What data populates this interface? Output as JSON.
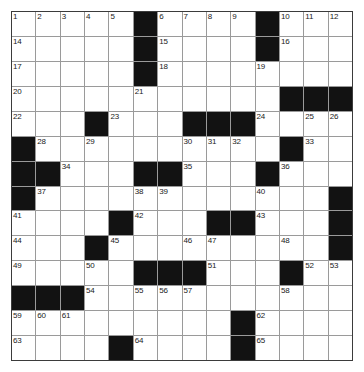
{
  "puzzle": {
    "type": "crossword-grid",
    "rows": 14,
    "cols": 14,
    "colors": {
      "block": "#121212",
      "cell": "#ffffff",
      "gridline": "#9a9a9a",
      "border": "#3b3b3b",
      "number_text": "#1a1a1a"
    },
    "grid": [
      [
        {
          "n": "1"
        },
        {
          "n": "2"
        },
        {
          "n": "3"
        },
        {
          "n": "4"
        },
        {
          "n": "5"
        },
        {
          "b": true
        },
        {
          "n": "6"
        },
        {
          "n": "7"
        },
        {
          "n": "8"
        },
        {
          "n": "9"
        },
        {
          "b": true
        },
        {
          "n": "10"
        },
        {
          "n": "11"
        },
        {
          "n": "12"
        }
      ],
      [
        {
          "n": "14"
        },
        {},
        {},
        {},
        {},
        {
          "b": true
        },
        {
          "n": "15"
        },
        {},
        {},
        {},
        {
          "b": true
        },
        {
          "n": "16"
        },
        {},
        {}
      ],
      [
        {
          "n": "17"
        },
        {},
        {},
        {},
        {},
        {
          "b": true
        },
        {
          "n": "18"
        },
        {},
        {},
        {},
        {
          "n": "19"
        },
        {},
        {},
        {}
      ],
      [
        {
          "n": "20"
        },
        {},
        {},
        {},
        {},
        {
          "n": "21"
        },
        {},
        {},
        {},
        {},
        {},
        {
          "b": true
        },
        {
          "b": true
        },
        {
          "b": true
        }
      ],
      [
        {
          "n": "22"
        },
        {},
        {},
        {
          "b": true
        },
        {
          "n": "23"
        },
        {},
        {},
        {
          "b": true
        },
        {
          "b": true
        },
        {
          "b": true
        },
        {
          "n": "24"
        },
        {},
        {
          "n": "25"
        },
        {
          "n": "26"
        }
      ],
      [
        {
          "b": true
        },
        {
          "n": "28"
        },
        {},
        {
          "n": "29"
        },
        {},
        {},
        {},
        {
          "n": "30"
        },
        {
          "n": "31"
        },
        {
          "n": "32"
        },
        {},
        {
          "b": true
        },
        {
          "n": "33"
        },
        {}
      ],
      [
        {
          "b": true
        },
        {
          "b": true
        },
        {
          "n": "34"
        },
        {},
        {},
        {
          "b": true
        },
        {
          "b": true
        },
        {
          "n": "35"
        },
        {},
        {},
        {
          "b": true
        },
        {
          "n": "36"
        },
        {},
        {}
      ],
      [
        {
          "b": true
        },
        {
          "n": "37"
        },
        {},
        {},
        {},
        {
          "n": "38"
        },
        {
          "n": "39"
        },
        {},
        {},
        {},
        {
          "n": "40"
        },
        {},
        {},
        {
          "b": true
        }
      ],
      [
        {
          "n": "41"
        },
        {},
        {},
        {},
        {
          "b": true
        },
        {
          "n": "42"
        },
        {},
        {},
        {
          "b": true
        },
        {
          "b": true
        },
        {
          "n": "43"
        },
        {},
        {},
        {
          "b": true
        }
      ],
      [
        {
          "n": "44"
        },
        {},
        {},
        {
          "b": true
        },
        {
          "n": "45"
        },
        {},
        {},
        {
          "n": "46"
        },
        {
          "n": "47"
        },
        {},
        {},
        {
          "n": "48"
        },
        {},
        {
          "b": true
        }
      ],
      [
        {
          "n": "49"
        },
        {},
        {},
        {
          "n": "50"
        },
        {},
        {
          "b": true
        },
        {
          "b": true
        },
        {
          "b": true
        },
        {
          "n": "51"
        },
        {},
        {},
        {
          "b": true
        },
        {
          "n": "52"
        },
        {
          "n": "53"
        }
      ],
      [
        {
          "b": true
        },
        {
          "b": true
        },
        {
          "b": true
        },
        {
          "n": "54"
        },
        {},
        {
          "n": "55"
        },
        {
          "n": "56"
        },
        {
          "n": "57"
        },
        {},
        {},
        {},
        {
          "n": "58"
        },
        {},
        {}
      ],
      [
        {
          "n": "59"
        },
        {
          "n": "60"
        },
        {
          "n": "61"
        },
        {},
        {},
        {},
        {},
        {},
        {},
        {
          "b": true
        },
        {
          "n": "62"
        },
        {},
        {},
        {}
      ],
      [
        {
          "n": "63"
        },
        {},
        {},
        {},
        {
          "b": true
        },
        {
          "n": "64"
        },
        {},
        {},
        {},
        {
          "b": true
        },
        {
          "n": "65"
        },
        {},
        {},
        {}
      ],
      [
        {
          "n": "66"
        },
        {},
        {},
        {},
        {
          "b": true
        },
        {
          "n": "67"
        },
        {},
        {},
        {},
        {
          "b": true
        },
        {
          "n": "68"
        },
        {},
        {},
        {}
      ]
    ]
  }
}
